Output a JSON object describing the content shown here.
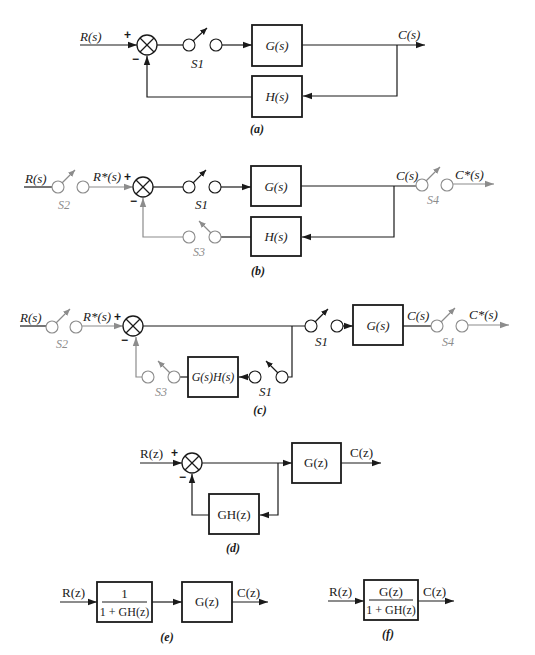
{
  "colors": {
    "line": "#1a1a1a",
    "sampler": "#8c8c8c",
    "background": "#ffffff"
  },
  "diagrams": {
    "a": {
      "caption": "(a)",
      "input": "R(s)",
      "output": "C(s)",
      "plus": "+",
      "minus": "−",
      "forward_block": "G(s)",
      "feedback_block": "H(s)",
      "switch_s1": "S1"
    },
    "b": {
      "caption": "(b)",
      "input": "R(s)",
      "sampled_input": "R*(s)",
      "output": "C(s)",
      "sampled_output": "C*(s)",
      "plus": "+",
      "minus": "−",
      "forward_block": "G(s)",
      "feedback_block": "H(s)",
      "switch_s1": "S1",
      "switch_s2": "S2",
      "switch_s3": "S3",
      "switch_s4": "S4"
    },
    "c": {
      "caption": "(c)",
      "input": "R(s)",
      "sampled_input": "R*(s)",
      "output": "C(s)",
      "sampled_output": "C*(s)",
      "plus": "+",
      "minus": "−",
      "forward_block": "G(s)",
      "feedback_block": "G(s)H(s)",
      "switch_s1_forward": "S1",
      "switch_s1_feedback": "S1",
      "switch_s2": "S2",
      "switch_s3": "S3",
      "switch_s4": "S4"
    },
    "d": {
      "caption": "(d)",
      "input": "R(z)",
      "output": "C(z)",
      "plus": "+",
      "minus": "−",
      "forward_block": "G(z)",
      "feedback_block": "GH(z)"
    },
    "e": {
      "caption": "(e)",
      "input": "R(z)",
      "output": "C(z)",
      "block1_numerator": "1",
      "block1_denominator": "1 + GH(z)",
      "block2": "G(z)"
    },
    "f": {
      "caption": "(f)",
      "input": "R(z)",
      "output": "C(z)",
      "block_numerator": "G(z)",
      "block_denominator": "1 + GH(z)"
    }
  }
}
